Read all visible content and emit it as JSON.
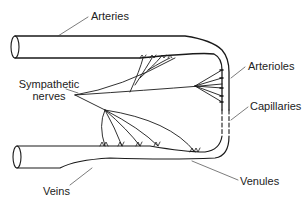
{
  "diagram": {
    "labels": {
      "arteries": "Arteries",
      "arterioles": "Arterioles",
      "sympathetic_line1": "Sympathetic",
      "sympathetic_line2": "nerves",
      "capillaries": "Capillaries",
      "venules": "Venules",
      "veins": "Veins"
    },
    "line_color": "#1a1a1a",
    "text_color": "#222222"
  }
}
